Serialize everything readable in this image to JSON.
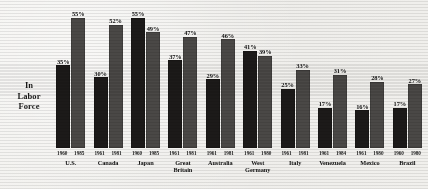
{
  "axis_label": {
    "line1": "In",
    "line2": "Labor",
    "line3": "Force"
  },
  "colors": {
    "background": "#f2f1ee",
    "bar_early": "#1c1a19",
    "bar_late": "#4a4846",
    "text": "#121212"
  },
  "chart_data": {
    "type": "bar",
    "title": "In Labor Force",
    "xlabel": "",
    "ylabel": "In Labor Force",
    "ylim": [
      0,
      60
    ],
    "grid": false,
    "legend_position": "none",
    "categories": [
      "U.S.",
      "Canada",
      "Japan",
      "Great Britain",
      "Australia",
      "West Germany",
      "Italy",
      "Venezuela",
      "Mexico",
      "Brazil"
    ],
    "series": [
      {
        "name": "Earlier year",
        "values": [
          35,
          30,
          55,
          37,
          29,
          41,
          25,
          17,
          16,
          17
        ],
        "labels": [
          "35%",
          "30%",
          "55%",
          "37%",
          "29%",
          "41%",
          "25%",
          "17%",
          "16%",
          "17%"
        ],
        "color": "#1c1a19"
      },
      {
        "name": "Later year",
        "values": [
          55,
          52,
          49,
          47,
          46,
          39,
          33,
          31,
          28,
          27
        ],
        "labels": [
          "55%",
          "52%",
          "49%",
          "47%",
          "46%",
          "39%",
          "33%",
          "31%",
          "28%",
          "27%"
        ],
        "color": "#4a4846"
      }
    ],
    "groups": [
      {
        "country": "U.S.",
        "country_line2": "",
        "year_early": "1960",
        "year_late": "1985",
        "value_early": 35,
        "value_late": 55,
        "label_early": "35%",
        "label_late": "55%"
      },
      {
        "country": "Canada",
        "country_line2": "",
        "year_early": "1961",
        "year_late": "1981",
        "value_early": 30,
        "value_late": 52,
        "label_early": "30%",
        "label_late": "52%"
      },
      {
        "country": "Japan",
        "country_line2": "",
        "year_early": "1960",
        "year_late": "1985",
        "value_early": 55,
        "value_late": 49,
        "label_early": "55%",
        "label_late": "49%"
      },
      {
        "country": "Great",
        "country_line2": "Britain",
        "year_early": "1961",
        "year_late": "1981",
        "value_early": 37,
        "value_late": 47,
        "label_early": "37%",
        "label_late": "47%"
      },
      {
        "country": "Australia",
        "country_line2": "",
        "year_early": "1961",
        "year_late": "1981",
        "value_early": 29,
        "value_late": 46,
        "label_early": "29%",
        "label_late": "46%"
      },
      {
        "country": "West",
        "country_line2": "Germany",
        "year_early": "1961",
        "year_late": "1980",
        "value_early": 41,
        "value_late": 39,
        "label_early": "41%",
        "label_late": "39%"
      },
      {
        "country": "Italy",
        "country_line2": "",
        "year_early": "1961",
        "year_late": "1981",
        "value_early": 25,
        "value_late": 33,
        "label_early": "25%",
        "label_late": "33%"
      },
      {
        "country": "Venezuela",
        "country_line2": "",
        "year_early": "1961",
        "year_late": "1984",
        "value_early": 17,
        "value_late": 31,
        "label_early": "17%",
        "label_late": "31%"
      },
      {
        "country": "Mexico",
        "country_line2": "",
        "year_early": "1961",
        "year_late": "1980",
        "value_early": 16,
        "value_late": 28,
        "label_early": "16%",
        "label_late": "28%"
      },
      {
        "country": "Brazil",
        "country_line2": "",
        "year_early": "1960",
        "year_late": "1980",
        "value_early": 17,
        "value_late": 27,
        "label_early": "17%",
        "label_late": "27%"
      }
    ]
  }
}
